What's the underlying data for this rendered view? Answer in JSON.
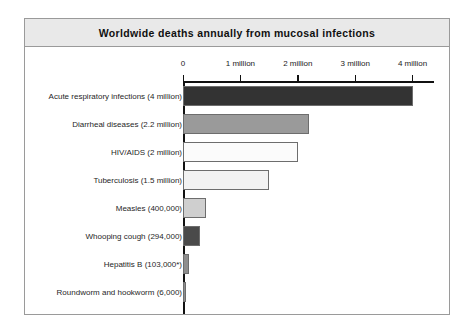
{
  "figure": {
    "title": "Worldwide deaths annually from mucosal infections",
    "frame_border_color": "#9a9a9a",
    "title_bar_color": "#e9e9e9",
    "background_color": "#ffffff"
  },
  "chart_data": {
    "type": "bar",
    "orientation": "horizontal",
    "title": "Worldwide deaths annually from mucosal infections",
    "xlabel": "",
    "ylabel": "",
    "xlim": [
      0,
      4400000
    ],
    "grid": false,
    "legend": "none",
    "tick_labels": [
      "0",
      "1 million",
      "2 million",
      "3 million",
      "4 million"
    ],
    "tick_values": [
      0,
      1000000,
      2000000,
      3000000,
      4000000
    ],
    "categories": [
      "Acute respiratory infections (4 million)",
      "Diarrheal diseases (2.2 million)",
      "HIV/AIDS (2 million)",
      "Tuberculosis (1.5 million)",
      "Measles (400,000)",
      "Whooping cough (294,000)",
      "Hepatitis B (103,000*)",
      "Roundworm and hookworm (6,000)"
    ],
    "values": [
      4000000,
      2200000,
      2000000,
      1500000,
      400000,
      294000,
      103000,
      6000
    ],
    "value_labels": [
      "4 million",
      "2.2 million",
      "2 million",
      "1.5 million",
      "400,000",
      "294,000",
      "103,000*",
      "6,000"
    ],
    "bar_colors": [
      "#333333",
      "#9a9a9a",
      "#fbfbfb",
      "#f2f2f2",
      "#cfcfcf",
      "#4a4a4a",
      "#8e8e8e",
      "#8e8e8e"
    ],
    "bar_edge_color": "#6d6d6d",
    "footnote": "*"
  }
}
